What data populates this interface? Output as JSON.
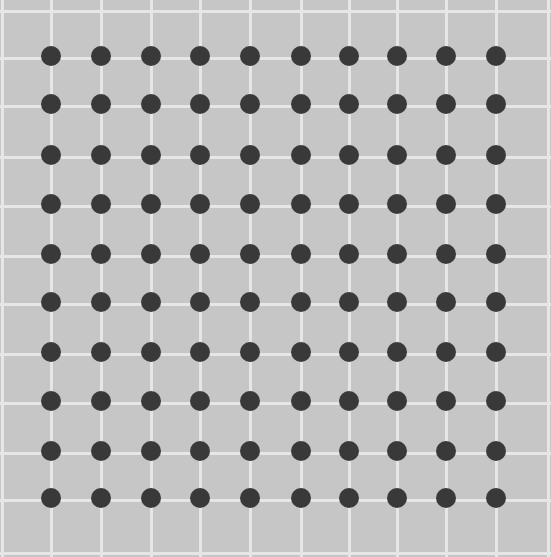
{
  "figure": {
    "type": "scintillating-grid",
    "grid_columns": 10,
    "grid_rows": 10,
    "dot_count": 100,
    "colors": {
      "background": "#c6c6c6",
      "grid_lines": "#e6e6e6",
      "dots": "#393939"
    },
    "column_x": [
      51,
      101,
      151,
      200,
      250,
      301,
      349,
      397,
      446,
      496
    ],
    "row_y": [
      56,
      104,
      155,
      204,
      254,
      302,
      352,
      401,
      451,
      498
    ],
    "extra_vlines": [
      2,
      548
    ],
    "extra_hlines": [
      9,
      551
    ]
  }
}
